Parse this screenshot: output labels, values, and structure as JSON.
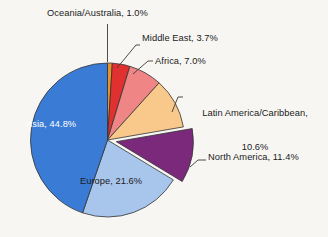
{
  "chart_data": {
    "type": "pie",
    "title": "",
    "subtitle": "",
    "xlabel": "",
    "ylabel": "",
    "legend_position": "none",
    "grid": false,
    "units": "percent",
    "total": 100.1,
    "start_angle_deg": 0,
    "direction": "clockwise",
    "exploded_slices": [
      "North America"
    ],
    "categories": [
      "Oceania/Australia",
      "Middle East",
      "Africa",
      "Latin America/Caribbean",
      "North America",
      "Europe",
      "Asia"
    ],
    "values": [
      1.0,
      3.7,
      7.0,
      10.6,
      11.4,
      21.6,
      44.8
    ],
    "colors": [
      "#E8922E",
      "#E03030",
      "#F08585",
      "#F8C98A",
      "#7B2A7B",
      "#A8C5EC",
      "#3A7BD5"
    ],
    "slices": [
      {
        "name": "Oceania/Australia",
        "value": 1.0,
        "label": "Oceania/Australia, 1.0%",
        "color": "#E8922E",
        "label_placement": "outside",
        "text_color": "#1b1b1b",
        "exploded": false
      },
      {
        "name": "Middle East",
        "value": 3.7,
        "label": "Middle East, 3.7%",
        "color": "#E03030",
        "label_placement": "outside",
        "text_color": "#1b1b1b",
        "exploded": false
      },
      {
        "name": "Africa",
        "value": 7.0,
        "label": "Africa, 7.0%",
        "color": "#F08585",
        "label_placement": "outside",
        "text_color": "#1b1b1b",
        "exploded": false
      },
      {
        "name": "Latin America/Caribbean",
        "value": 10.6,
        "label": "Latin America/Caribbean,\n10.6%",
        "color": "#F8C98A",
        "label_placement": "outside",
        "text_color": "#1b1b1b",
        "exploded": false
      },
      {
        "name": "North America",
        "value": 11.4,
        "label": "North America, 11.4%",
        "color": "#7B2A7B",
        "label_placement": "outside",
        "text_color": "#1b1b1b",
        "exploded": true
      },
      {
        "name": "Europe",
        "value": 21.6,
        "label": "Europe, 21.6%",
        "color": "#A8C5EC",
        "label_placement": "inside",
        "text_color": "#1b1b1b",
        "exploded": false
      },
      {
        "name": "Asia",
        "value": 44.8,
        "label": "Asia, 44.8%",
        "color": "#3A7BD5",
        "label_placement": "inside",
        "text_color": "#ffffff",
        "exploded": false
      }
    ]
  },
  "labels": {
    "oceania": "Oceania/Australia, 1.0%",
    "middle_east": "Middle East, 3.7%",
    "africa": "Africa, 7.0%",
    "latin_america_line1": "Latin America/Caribbean,",
    "latin_america_line2": "10.6%",
    "north_america": "North America, 11.4%",
    "asia": "Asia, 44.8%",
    "europe": "Europe, 21.6%"
  },
  "style": {
    "background": "#f7f6f3",
    "slice_outline": "#333333",
    "leader_line": "#3a3a3a",
    "text_color": "#1b1b1b",
    "asia_text_color": "#ffffff"
  }
}
